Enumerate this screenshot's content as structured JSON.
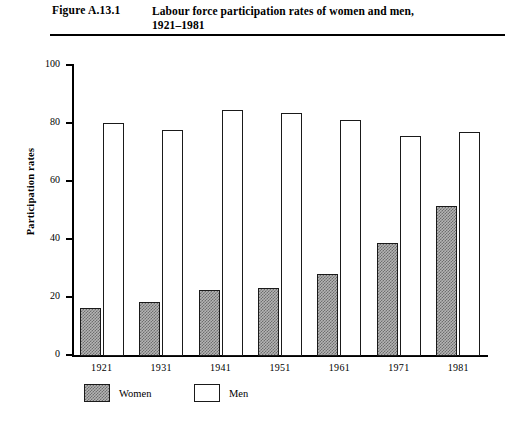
{
  "header": {
    "figure_number": "Figure A.13.1",
    "caption_line1": "Labour force participation rates of women and men,",
    "caption_line2": "1921–1981"
  },
  "chart_data": {
    "type": "bar",
    "title": "Labour force participation rates of women and men, 1921–1981",
    "xlabel": "",
    "ylabel": "Participation rates",
    "ylim": [
      0,
      100
    ],
    "yticks": [
      0,
      20,
      40,
      60,
      80,
      100
    ],
    "ytick_labels": [
      "0",
      "20",
      "40",
      "60",
      "80",
      "100"
    ],
    "grid": false,
    "legend_position": "below-axis-left",
    "categories": [
      "1921",
      "1931",
      "1941",
      "1951",
      "1961",
      "1971",
      "1981"
    ],
    "series": [
      {
        "name": "Women",
        "color": "#b4b4b4",
        "pattern": "stipple-checker",
        "values": [
          16.3,
          18.4,
          22.5,
          23.0,
          28.0,
          38.5,
          51.3
        ]
      },
      {
        "name": "Men",
        "color": "#ffffff",
        "pattern": "solid-outline",
        "values": [
          80.0,
          77.5,
          84.5,
          83.5,
          81.0,
          75.5,
          77.0
        ]
      }
    ]
  },
  "legend": {
    "items": [
      {
        "label": "Women",
        "swatch": "women"
      },
      {
        "label": "Men",
        "swatch": "men"
      }
    ]
  },
  "colors": {
    "axis": "#000000",
    "bar_outline": "#1a1a1a",
    "women_fill": "#b4b4b4",
    "men_fill": "#ffffff",
    "page_background": "#ffffff"
  }
}
